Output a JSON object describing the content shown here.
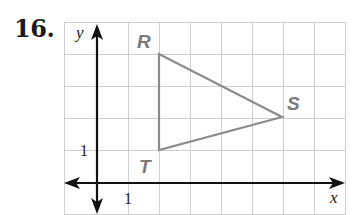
{
  "problem": {
    "number": "16."
  },
  "axes": {
    "x_label": "x",
    "y_label": "y",
    "x_tick": "1",
    "y_tick": "1"
  },
  "colors": {
    "triangle": "#8c8c8c",
    "vertex_label": "#7a7a7a",
    "grid": "#cfcfcf",
    "axis": "#111111"
  },
  "triangle": {
    "vertices": [
      {
        "label": "R",
        "x": 2,
        "y": 4
      },
      {
        "label": "S",
        "x": 6,
        "y": 2
      },
      {
        "label": "T",
        "x": 2,
        "y": 1
      }
    ]
  },
  "grid": {
    "x_min": -1,
    "x_max": 8,
    "y_min": -1,
    "y_max": 5,
    "unit": 1
  }
}
